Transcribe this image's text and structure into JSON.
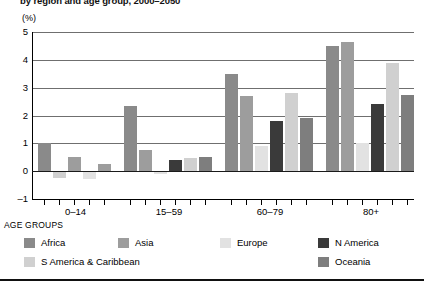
{
  "header": {
    "title": "by region and age group, 2000–2050",
    "unit": "(%)"
  },
  "axis": {
    "y_label": "(%)",
    "y_ticks": [
      "5",
      "4",
      "3",
      "2",
      "1",
      "0",
      "–1"
    ],
    "x_axis_caption": "AGE GROUPS",
    "x_group_labels": [
      "0–14",
      "15–59",
      "60–79",
      "80+"
    ]
  },
  "legend": {
    "items": [
      {
        "label": "Africa",
        "color": "#8a8a8a"
      },
      {
        "label": "Asia",
        "color": "#9d9d9d"
      },
      {
        "label": "Europe",
        "color": "#e2e2e2"
      },
      {
        "label": "N America",
        "color": "#3a3a3a"
      },
      {
        "label": "S America & Caribbean",
        "color": "#d0d0d0"
      },
      {
        "label": "Oceania",
        "color": "#7e7e7e"
      }
    ]
  },
  "chart_data": {
    "type": "bar",
    "title": "by region and age group, 2000–2050",
    "xlabel": "AGE GROUPS",
    "ylabel": "(%)",
    "ylim": [
      -1,
      5
    ],
    "grid": true,
    "legend_position": "bottom",
    "categories": [
      "0–14",
      "15–59",
      "60–79",
      "80+"
    ],
    "series": [
      {
        "name": "Africa",
        "color": "#8a8a8a",
        "values": [
          1.0,
          0.0,
          3.5,
          2.9
        ]
      },
      {
        "name": "Asia",
        "color": "#9d9d9d",
        "values": [
          -0.2,
          2.35,
          2.7,
          4.5
        ]
      },
      {
        "name": "Europe",
        "color": "#e2e2e2",
        "values": [
          -0.65,
          0.0,
          0.9,
          1.45
        ]
      },
      {
        "name": "N America",
        "color": "#3a3a3a",
        "values": [
          0.5,
          0.4,
          1.8,
          2.4
        ]
      },
      {
        "name": "S America & Caribbean",
        "color": "#d0d0d0",
        "values": [
          -0.25,
          0.45,
          2.8,
          3.9
        ]
      },
      {
        "name": "Oceania",
        "color": "#7e7e7e",
        "values": [
          0.25,
          0.5,
          1.9,
          2.75
        ]
      }
    ],
    "group_bar_order": [
      {
        "group": "0–14",
        "bars": [
          {
            "series": "Africa",
            "value": 1.0
          },
          {
            "series": "Europe",
            "value": -0.2
          },
          {
            "series": "N America",
            "value": 0.5
          },
          {
            "series": "S America & Caribbean",
            "value": -0.25
          },
          {
            "series": "Oceania",
            "value": 0.25
          }
        ]
      },
      {
        "group": "15–59",
        "bars": [
          {
            "series": "Asia",
            "value": 2.35
          },
          {
            "series": "Africa",
            "value": 0.75
          },
          {
            "series": "Europe",
            "value": -0.15
          },
          {
            "series": "N America",
            "value": 0.4
          },
          {
            "series": "S America & Caribbean",
            "value": 0.45
          },
          {
            "series": "Oceania",
            "value": 0.5
          }
        ]
      },
      {
        "group": "60–79",
        "bars": [
          {
            "series": "N America",
            "value": 0.75
          },
          {
            "series": "S America & Caribbean",
            "value": 0.9
          },
          {
            "series": "Oceania",
            "value": 0.75
          },
          {
            "series": "Africa",
            "value": 3.5
          },
          {
            "series": "Asia",
            "value": 2.7
          },
          {
            "series": "Europe",
            "value": 0.9
          },
          {
            "series": "N America",
            "value": 1.8
          },
          {
            "series": "S America & Caribbean",
            "value": 2.8
          },
          {
            "series": "Oceania",
            "value": 1.9
          }
        ]
      },
      {
        "group": "80+",
        "bars": [
          {
            "series": "Africa",
            "value": 2.0
          },
          {
            "series": "Europe",
            "value": 1.0
          },
          {
            "series": "N America",
            "value": 1.45
          },
          {
            "series": "S America & Caribbean",
            "value": 1.95
          },
          {
            "series": "Oceania",
            "value": 1.45
          },
          {
            "series": "Africa",
            "value": 4.5
          },
          {
            "series": "Oceania",
            "value": 4.65
          },
          {
            "series": "Asia",
            "value": 2.4
          },
          {
            "series": "Europe",
            "value": 3.9
          },
          {
            "series": "N America",
            "value": 2.75
          }
        ]
      }
    ],
    "rendered_bars": [
      {
        "x": 38,
        "value": 1.0,
        "color": "#8a8a8a"
      },
      {
        "x": 53,
        "value": -0.25,
        "color": "#d0d0d0"
      },
      {
        "x": 68,
        "value": 0.5,
        "color": "#9d9d9d"
      },
      {
        "x": 83,
        "value": -0.28,
        "color": "#e2e2e2"
      },
      {
        "x": 98,
        "value": 0.25,
        "color": "#9d9d9d"
      },
      {
        "x": 124,
        "value": 2.35,
        "color": "#8a8a8a"
      },
      {
        "x": 139,
        "value": 0.75,
        "color": "#9d9d9d"
      },
      {
        "x": 154,
        "value": -0.12,
        "color": "#e2e2e2"
      },
      {
        "x": 169,
        "value": 0.4,
        "color": "#3a3a3a"
      },
      {
        "x": 184,
        "value": 0.48,
        "color": "#d0d0d0"
      },
      {
        "x": 199,
        "value": 0.5,
        "color": "#7e7e7e"
      },
      {
        "x": 225,
        "value": 3.5,
        "color": "#8a8a8a"
      },
      {
        "x": 240,
        "value": 2.7,
        "color": "#9d9d9d"
      },
      {
        "x": 255,
        "value": 0.9,
        "color": "#e2e2e2"
      },
      {
        "x": 270,
        "value": 1.8,
        "color": "#3a3a3a"
      },
      {
        "x": 285,
        "value": 2.8,
        "color": "#d0d0d0"
      },
      {
        "x": 300,
        "value": 1.9,
        "color": "#7e7e7e"
      },
      {
        "x": 326,
        "value": 4.5,
        "color": "#8a8a8a"
      },
      {
        "x": 341,
        "value": 4.65,
        "color": "#9d9d9d"
      },
      {
        "x": 356,
        "value": 1.0,
        "color": "#e2e2e2"
      },
      {
        "x": 371,
        "value": 2.4,
        "color": "#3a3a3a"
      },
      {
        "x": 386,
        "value": 3.9,
        "color": "#d0d0d0"
      },
      {
        "x": 401,
        "value": 2.75,
        "color": "#7e7e7e"
      }
    ]
  }
}
